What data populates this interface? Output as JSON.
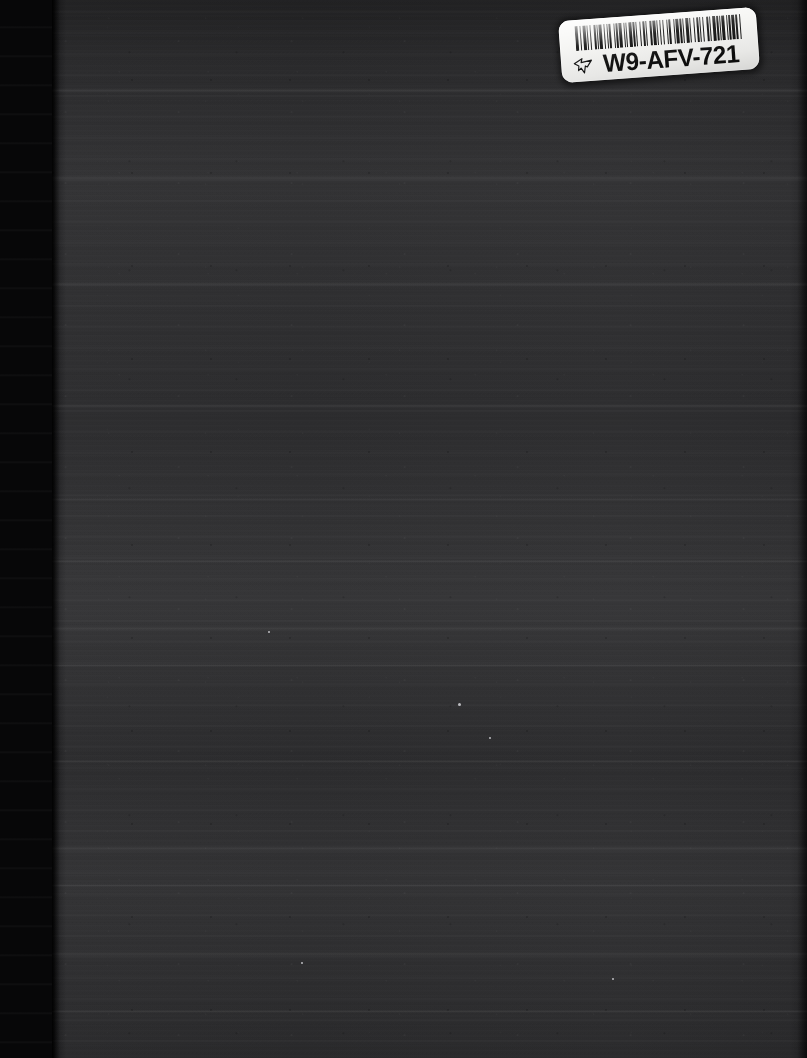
{
  "page": {
    "kind": "scanned-page",
    "width": 807,
    "height": 1058,
    "background_color": "#2c2c2e",
    "gutter_color": "#070708"
  },
  "barcode_label": {
    "code_text": "W9-AFV-721",
    "label_color": "#f4f4f2",
    "ink_color": "#0b0b0b",
    "symbology": "Code 39",
    "icon_name": "pointing-hand-icon",
    "bar_pattern": [
      3,
      2,
      1,
      2,
      3,
      1,
      1,
      2,
      1,
      3,
      2,
      1,
      1,
      1,
      3,
      2,
      1,
      2,
      1,
      1,
      2,
      3,
      1,
      1,
      2,
      1,
      3,
      2,
      1,
      1,
      1,
      2,
      3,
      1,
      2,
      1,
      1,
      3,
      1,
      2,
      2,
      1,
      1,
      3,
      2,
      1,
      3,
      1,
      1,
      2,
      1,
      2,
      1,
      3,
      1,
      1,
      2,
      3,
      1,
      1,
      3,
      1,
      2,
      1,
      1,
      2,
      3,
      1,
      1,
      3,
      1,
      2,
      2,
      1,
      1,
      2,
      1,
      3,
      2,
      1,
      1,
      2,
      3,
      1,
      2,
      1,
      1,
      1,
      3,
      2,
      1,
      1,
      2,
      1,
      3,
      1,
      2,
      2,
      1,
      3
    ]
  },
  "scan_artifacts": {
    "bands": [
      {
        "top": 88,
        "height": 5
      },
      {
        "top": 176,
        "height": 4
      },
      {
        "top": 282,
        "height": 4
      },
      {
        "top": 404,
        "height": 4
      },
      {
        "top": 498,
        "height": 3
      },
      {
        "top": 560,
        "height": 3
      },
      {
        "top": 626,
        "height": 5
      },
      {
        "top": 664,
        "height": 3
      },
      {
        "top": 760,
        "height": 3
      },
      {
        "top": 846,
        "height": 5
      },
      {
        "top": 884,
        "height": 3
      },
      {
        "top": 952,
        "height": 4
      },
      {
        "top": 1010,
        "height": 3
      }
    ],
    "specks": [
      {
        "left": 458,
        "top": 703,
        "size": 3
      },
      {
        "left": 489,
        "top": 737,
        "size": 2
      },
      {
        "left": 268,
        "top": 631,
        "size": 2
      },
      {
        "left": 612,
        "top": 978,
        "size": 2
      },
      {
        "left": 301,
        "top": 962,
        "size": 2
      }
    ]
  }
}
